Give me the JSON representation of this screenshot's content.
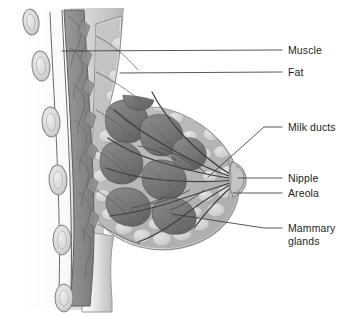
{
  "figure": {
    "type": "medical-illustration",
    "style": "grayscale",
    "background_color": "#ffffff",
    "ink_color": "#231f20",
    "leader_line_color": "#3a3a3a"
  },
  "labels": [
    {
      "id": "muscle",
      "text": "Muscle",
      "x": 288,
      "y": 44,
      "leader_from_x": 282,
      "leader_from_y": 50,
      "leader_to_x": 62,
      "leader_to_y": 51
    },
    {
      "id": "fat",
      "text": "Fat",
      "x": 288,
      "y": 66,
      "leader_from_x": 282,
      "leader_from_y": 72,
      "leader_to_x": 120,
      "leader_to_y": 73
    },
    {
      "id": "milk-ducts",
      "text": "Milk ducts",
      "x": 288,
      "y": 121,
      "leader_from_x": 282,
      "leader_from_y": 127,
      "leader_to_x": 208,
      "leader_to_y": 177
    },
    {
      "id": "nipple",
      "text": "Nipple",
      "x": 288,
      "y": 172,
      "leader_from_x": 282,
      "leader_from_y": 178,
      "leader_to_x": 238,
      "leader_to_y": 178
    },
    {
      "id": "areola",
      "text": "Areola",
      "x": 288,
      "y": 187,
      "leader_from_x": 282,
      "leader_from_y": 193,
      "leader_to_x": 233,
      "leader_to_y": 193
    },
    {
      "id": "mammary-glands",
      "text": "Mammary\nglands",
      "x": 288,
      "y": 222,
      "leader_from_x": 282,
      "leader_from_y": 228,
      "leader_to_x": 172,
      "leader_to_y": 214
    }
  ],
  "caption": {
    "text": ""
  }
}
